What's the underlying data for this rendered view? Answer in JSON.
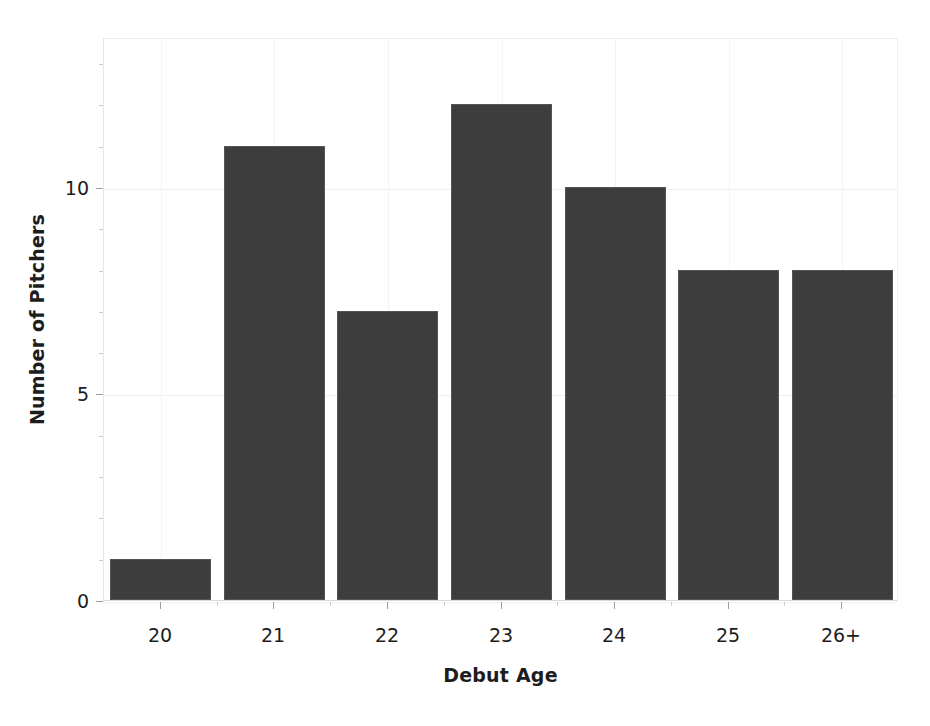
{
  "chart_data": {
    "type": "bar",
    "title": "",
    "subtitle": "",
    "xlabel": "Debut Age",
    "ylabel": "Number of Pitchers",
    "categories": [
      "20",
      "21",
      "22",
      "23",
      "24",
      "25",
      "26+"
    ],
    "values": [
      1,
      11,
      7,
      12,
      10,
      8,
      8
    ],
    "series": [
      {
        "name": "Number of Pitchers",
        "values": [
          1,
          11,
          7,
          12,
          10,
          8,
          8
        ]
      }
    ],
    "ylim": [
      0,
      13.63
    ],
    "xlim": [
      19.48,
      26.78
    ],
    "ytick_labels": [
      "0",
      "5",
      "10"
    ],
    "ytick_values": [
      0,
      5,
      10
    ],
    "yminor_step": 1,
    "xtick_labels": [
      "20",
      "21",
      "22",
      "23",
      "24",
      "25",
      "26+"
    ],
    "grid": "both-faint",
    "legend": "none",
    "bar_color": "#3d3d3d",
    "bar_edge_color": "#555555",
    "background_color": "#ffffff",
    "axis_text_color": "#1d1d1d",
    "gridline_color": "#f0f0f2",
    "annotations": []
  },
  "figure": {
    "alt": "Bar chart of number of pitchers by debut age"
  }
}
